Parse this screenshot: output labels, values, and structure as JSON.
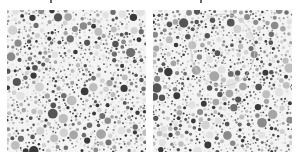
{
  "figure": {
    "panels": [
      {
        "id": "left",
        "description": "Grayscale dot-pattern plate (color vision test style)",
        "seed": 17,
        "dot_count": 900,
        "highlight_arc": false
      },
      {
        "id": "right",
        "description": "Grayscale dot-pattern plate with faint circular annotation arc near top",
        "seed": 53,
        "dot_count": 900,
        "highlight_arc": true
      }
    ],
    "palette": [
      "#3a3a3a",
      "#555555",
      "#6e6e6e",
      "#8a8a8a",
      "#a6a6a6",
      "#bebebe",
      "#d2d2d2",
      "#e2e2e2"
    ],
    "captions": {
      "left": "",
      "right": ""
    }
  }
}
